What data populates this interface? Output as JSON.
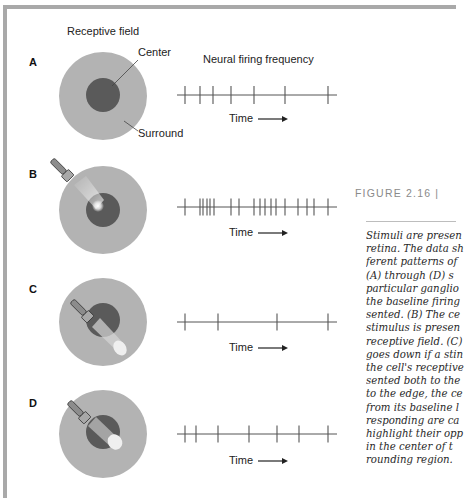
{
  "headers": {
    "receptive_field": "Receptive field",
    "neural_firing": "Neural firing frequency"
  },
  "annotations": {
    "center": "Center",
    "surround": "Surround"
  },
  "panels": [
    {
      "letter": "A",
      "time_label": "Time",
      "stimulus": "none"
    },
    {
      "letter": "B",
      "time_label": "Time",
      "stimulus": "center"
    },
    {
      "letter": "C",
      "time_label": "Time",
      "stimulus": "surround"
    },
    {
      "letter": "D",
      "time_label": "Time",
      "stimulus": "center-and-surround"
    }
  ],
  "caption": {
    "title": "FIGURE 2.16  |",
    "lines": [
      "Stimuli are presen",
      "retina. The data sh",
      "ferent patterns of",
      "(A) through (D) s",
      "particular ganglio",
      "the baseline firing",
      "sented. (B) The ce",
      "stimulus is presen",
      "receptive field. (C)",
      "goes down if a stin",
      "the cell's receptive",
      "sented both to the",
      "to the edge, the ce",
      "from its baseline l",
      "responding are ca",
      "highlight their opp",
      "in the center of t",
      "rounding region."
    ]
  },
  "chart_data": {
    "type": "table",
    "title": "Neural firing frequency",
    "xlabel": "Time",
    "series": [
      {
        "name": "A - no stimulus (baseline)",
        "spike_count": 7,
        "spike_x_px": [
          185,
          200,
          213,
          231,
          254,
          285,
          328
        ]
      },
      {
        "name": "B - light on center",
        "spike_count": 18,
        "spike_x_px": [
          185,
          200,
          203,
          207,
          210,
          214,
          231,
          239,
          254,
          260,
          265,
          271,
          276,
          285,
          298,
          307,
          314,
          328
        ]
      },
      {
        "name": "C - light on surround",
        "spike_count": 4,
        "spike_x_px": [
          185,
          218,
          277,
          328
        ]
      },
      {
        "name": "D - light on center and surround",
        "spike_count": 7,
        "spike_x_px": [
          185,
          196,
          218,
          249,
          277,
          299,
          328
        ]
      }
    ]
  },
  "colors": {
    "surround": "#b3b3b3",
    "center": "#5a5a5a",
    "frame": "#a9a9a9",
    "axis": "#555555"
  }
}
